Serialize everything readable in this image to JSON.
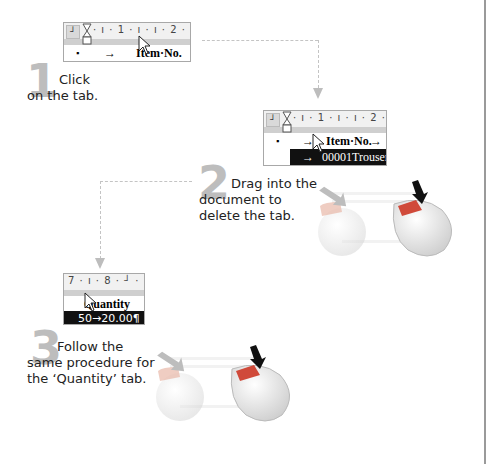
{
  "steps": [
    {
      "number": "1",
      "text_line1": "Click",
      "text_line2": "on the tab.",
      "ruler": {
        "ticks": "· ı · 1 · ı · ı · 2 · ı · ı 3",
        "tab_selector": "┘"
      },
      "rows": [
        {
          "bullet": "▪",
          "arrow": "→",
          "label": "Item·No."
        }
      ]
    },
    {
      "number": "2",
      "text_line1": "Drag into the",
      "text_line2": "document to",
      "text_line3": "delete the tab.",
      "ruler": {
        "ticks": "· ı · 1 · ı · ı · 2 · ı ┘3 · ı",
        "tab_selector": "┘"
      },
      "rows": [
        {
          "bullet": "▪",
          "arrow": "→",
          "label": "Item·No.",
          "arrow2": "→"
        },
        {
          "arrow": "→",
          "label": "00001Trousers",
          "highlighted": true
        }
      ]
    },
    {
      "number": "3",
      "text_line1": "Follow the",
      "text_line2": "same procedure for",
      "text_line3": "the ‘Quantity’ tab.",
      "ruler": {
        "ticks": "7 · ı · 8 · ┘ ·"
      },
      "rows": [
        {
          "label": "Quantity"
        },
        {
          "label": "50→20.00¶",
          "highlighted": true
        }
      ]
    }
  ],
  "colors": {
    "step_number": "#bdbdbd",
    "connector": "#c4c4c4",
    "highlight_bg": "#111111",
    "mouse_button_active": "#d04a3a",
    "mouse_button_ghost": "#e8b8a8"
  }
}
